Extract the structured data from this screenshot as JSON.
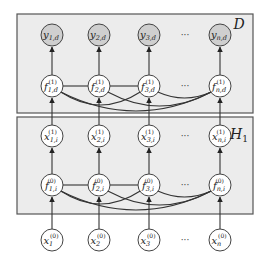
{
  "diagram": {
    "type": "graphical-model",
    "colors": {
      "plate_fill": "#ececec",
      "plate_stroke": "#555555",
      "observed_fill": "#cfcfcf",
      "latent_fill": "#ffffff"
    },
    "plates": [
      {
        "id": "D",
        "label": "D",
        "x": 17,
        "y": 14,
        "w": 236,
        "h": 99
      },
      {
        "id": "H1",
        "label": "H",
        "label_sub": "1",
        "x": 17,
        "y": 117,
        "w": 236,
        "h": 97
      }
    ],
    "columns_x": [
      52,
      99,
      149,
      220
    ],
    "dots_x": 185,
    "rows": {
      "y_out": {
        "y": 35,
        "observed": true,
        "labels": [
          {
            "base": "y",
            "sub": "1,d",
            "sup": ""
          },
          {
            "base": "y",
            "sub": "2,d",
            "sup": ""
          },
          {
            "base": "y",
            "sub": "3,d",
            "sup": ""
          },
          {
            "base": "y",
            "sub": "n,d",
            "sup": ""
          }
        ]
      },
      "f1": {
        "y": 86,
        "observed": false,
        "labels": [
          {
            "base": "f",
            "sub": "1,d",
            "sup": "(1)"
          },
          {
            "base": "f",
            "sub": "2,d",
            "sup": "(1)"
          },
          {
            "base": "f",
            "sub": "3,d",
            "sup": "(1)"
          },
          {
            "base": "f",
            "sub": "n,d",
            "sup": "(1)"
          }
        ]
      },
      "x1": {
        "y": 136,
        "observed": false,
        "labels": [
          {
            "base": "x",
            "sub": "1,i",
            "sup": "(1)"
          },
          {
            "base": "x",
            "sub": "2,i",
            "sup": "(1)"
          },
          {
            "base": "x",
            "sub": "3,i",
            "sup": "(1)"
          },
          {
            "base": "x",
            "sub": "n,i",
            "sup": "(1)"
          }
        ]
      },
      "f0": {
        "y": 185,
        "observed": false,
        "labels": [
          {
            "base": "f",
            "sub": "1,i",
            "sup": "(0)"
          },
          {
            "base": "f",
            "sub": "2,i",
            "sup": "(0)"
          },
          {
            "base": "f",
            "sub": "3,i",
            "sup": "(0)"
          },
          {
            "base": "f",
            "sub": "n,i",
            "sup": "(0)"
          }
        ]
      },
      "x0": {
        "y": 240,
        "observed": false,
        "labels": [
          {
            "base": "x",
            "sub": "1",
            "sup": "(0)"
          },
          {
            "base": "x",
            "sub": "2",
            "sup": "(0)"
          },
          {
            "base": "x",
            "sub": "3",
            "sup": "(0)"
          },
          {
            "base": "x",
            "sub": "n",
            "sup": "(0)"
          }
        ]
      }
    },
    "ellipsis": "···",
    "node_radius": 11
  }
}
